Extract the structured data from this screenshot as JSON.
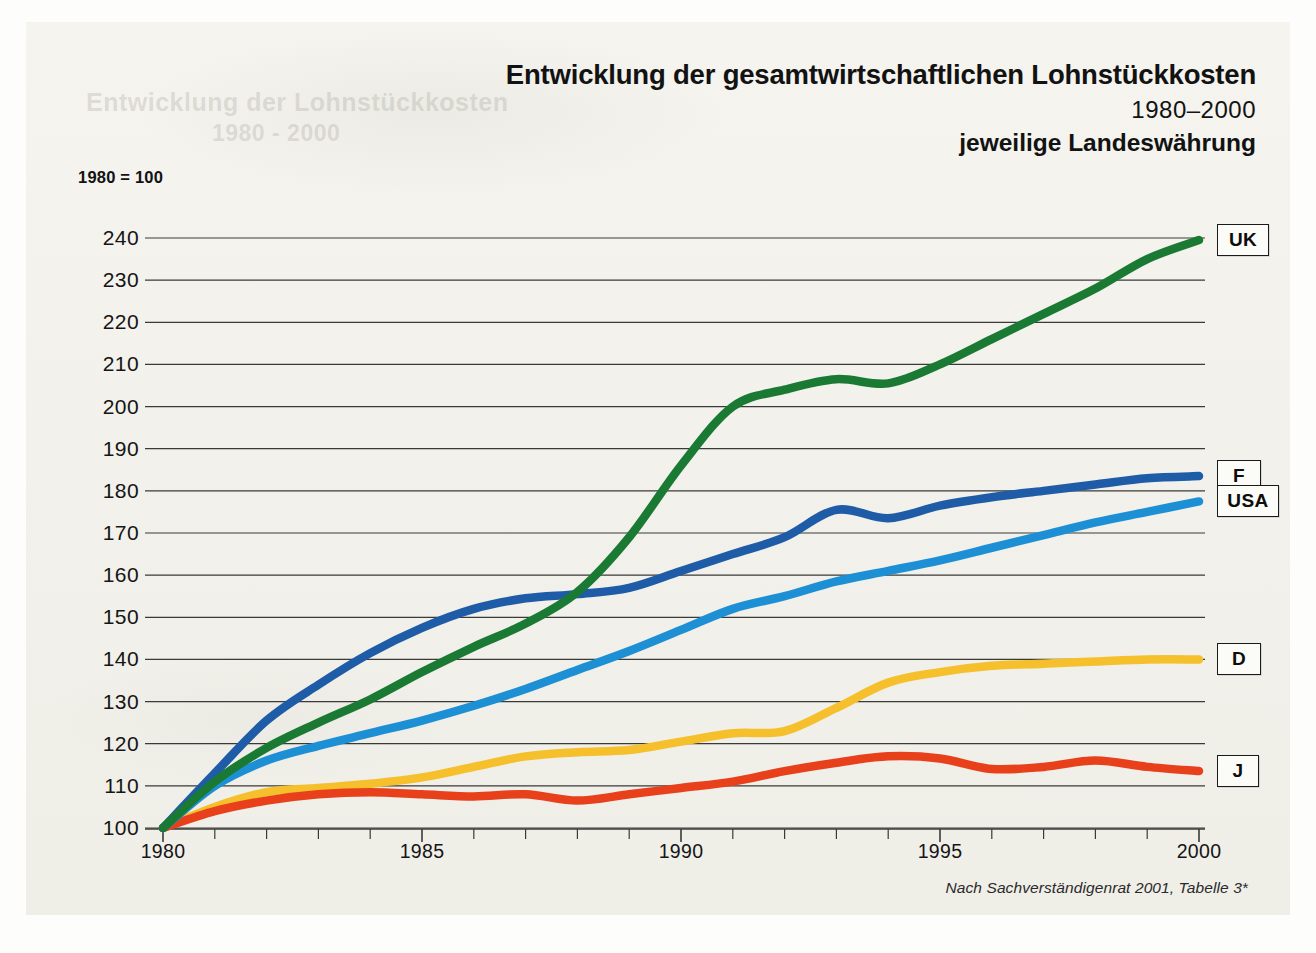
{
  "title": {
    "main": "Entwicklung der gesamtwirtschaftlichen Lohnstückkosten",
    "years": "1980–2000",
    "sub": "jeweilige Landeswährung"
  },
  "index_note": "1980 = 100",
  "source_note": "Nach Sachverständigenrat 2001, Tabelle 3*",
  "bleed_text": {
    "line1": "Entwicklung der Lohnstückkosten",
    "line2": "1980 - 2000"
  },
  "chart_data": {
    "type": "line",
    "title": "Entwicklung der gesamtwirtschaftlichen Lohnstückkosten",
    "subtitle": "1980–2000 — jeweilige Landeswährung",
    "xlabel": "",
    "ylabel": "1980 = 100",
    "xlim": [
      1980,
      2000
    ],
    "ylim": [
      100,
      240
    ],
    "yticks": [
      100,
      110,
      120,
      130,
      140,
      150,
      160,
      170,
      180,
      190,
      200,
      210,
      220,
      230,
      240
    ],
    "xticks": [
      1980,
      1981,
      1982,
      1983,
      1984,
      1985,
      1986,
      1987,
      1988,
      1989,
      1990,
      1991,
      1992,
      1993,
      1994,
      1995,
      1996,
      1997,
      1998,
      1999,
      2000
    ],
    "xtick_labels": [
      1980,
      1985,
      1990,
      1995,
      2000
    ],
    "grid": "horizontal",
    "legend_position": "right-inline-tags",
    "x": [
      1980,
      1981,
      1982,
      1983,
      1984,
      1985,
      1986,
      1987,
      1988,
      1989,
      1990,
      1991,
      1992,
      1993,
      1994,
      1995,
      1996,
      1997,
      1998,
      1999,
      2000
    ],
    "series": [
      {
        "name": "UK",
        "label": "UK",
        "color": "#1a7a34",
        "values": [
          100,
          111,
          119,
          125,
          130.5,
          137,
          143,
          148.5,
          156,
          169,
          186,
          200,
          204,
          206.5,
          205.5,
          210,
          216,
          222,
          228,
          235,
          239.5
        ]
      },
      {
        "name": "F",
        "label": "F",
        "color": "#1f5ca8",
        "values": [
          100,
          113,
          125.5,
          134,
          141.5,
          147.5,
          152,
          154.5,
          155.5,
          157,
          161,
          165,
          169,
          175.5,
          173.5,
          176.5,
          178.5,
          180,
          181.5,
          183,
          183.5
        ]
      },
      {
        "name": "USA",
        "label": "USA",
        "color": "#1d8fd4",
        "values": [
          100,
          110,
          116,
          119.5,
          122.5,
          125.5,
          129,
          133,
          137.5,
          142,
          147,
          152,
          155,
          158.5,
          161,
          163.5,
          166.5,
          169.5,
          172.5,
          175,
          177.5
        ]
      },
      {
        "name": "D",
        "label": "D",
        "color": "#f5c02b",
        "values": [
          100,
          105,
          108.5,
          109.5,
          110.5,
          112,
          114.5,
          117,
          118,
          118.5,
          120.5,
          122.5,
          123,
          128.5,
          134.5,
          137,
          138.5,
          139,
          139.5,
          140,
          140
        ]
      },
      {
        "name": "J",
        "label": "J",
        "color": "#e8401a",
        "values": [
          100,
          104,
          106.5,
          108,
          108.5,
          108,
          107.5,
          108,
          106.5,
          108,
          109.5,
          111,
          113.5,
          115.5,
          117,
          116.5,
          114,
          114.5,
          116,
          114.5,
          113.5
        ]
      }
    ]
  }
}
